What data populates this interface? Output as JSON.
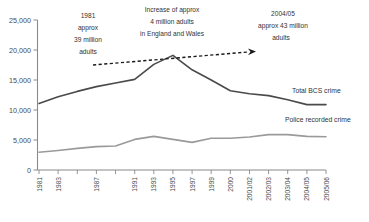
{
  "chart_data": {
    "type": "line",
    "title": "",
    "xlabel": "",
    "ylabel": "",
    "ylim": [
      0,
      25000
    ],
    "ytick_values": [
      0,
      5000,
      10000,
      15000,
      20000,
      25000
    ],
    "ytick_labels": [
      "0",
      "5,000",
      "10,000",
      "15,000",
      "20,000",
      "25,000"
    ],
    "grid": false,
    "legend_position": "inline-right",
    "categories": [
      "1981",
      "1983",
      "1985",
      "1987",
      "1989",
      "1991",
      "1993",
      "1995",
      "1997",
      "1999",
      "2000",
      "2001/02",
      "2002/03",
      "2003/04",
      "2004/05",
      "2005/06"
    ],
    "xtick_labels": [
      "1981",
      "1983",
      "",
      "1987",
      "",
      "1991",
      "1993",
      "1995",
      "1997",
      "1999",
      "2000",
      "2001/02",
      "2002/03",
      "2003/04",
      "2004/05",
      "2005/06"
    ],
    "series": [
      {
        "name": "Total BCS crime",
        "color": "#4a4a4a",
        "values": [
          11100,
          12200,
          13100,
          13900,
          14500,
          15100,
          17600,
          19100,
          16700,
          15000,
          13200,
          12700,
          12400,
          11700,
          10900,
          10900
        ]
      },
      {
        "name": "Police recorded crime",
        "color": "#9a9a9a",
        "values": [
          2950,
          3250,
          3600,
          3900,
          4000,
          5100,
          5600,
          5100,
          4600,
          5300,
          5300,
          5500,
          5900,
          5900,
          5600,
          5550
        ]
      }
    ],
    "annotations": [
      {
        "id": "left-population-note",
        "lines": [
          "1981",
          "approx",
          "39 million",
          "adults"
        ]
      },
      {
        "id": "center-increase-note",
        "lines": [
          "Increase of approx",
          "4 million adults",
          "in England and Wales"
        ]
      },
      {
        "id": "right-population-note",
        "lines": [
          "2004/05",
          "approx 43 million",
          "adults"
        ]
      }
    ],
    "trend_arrow": {
      "style": "dashed",
      "color": "#1a1a1a",
      "from_value": 17500,
      "to_value": 19700,
      "description": "dashed arrow showing adult population growth"
    }
  }
}
